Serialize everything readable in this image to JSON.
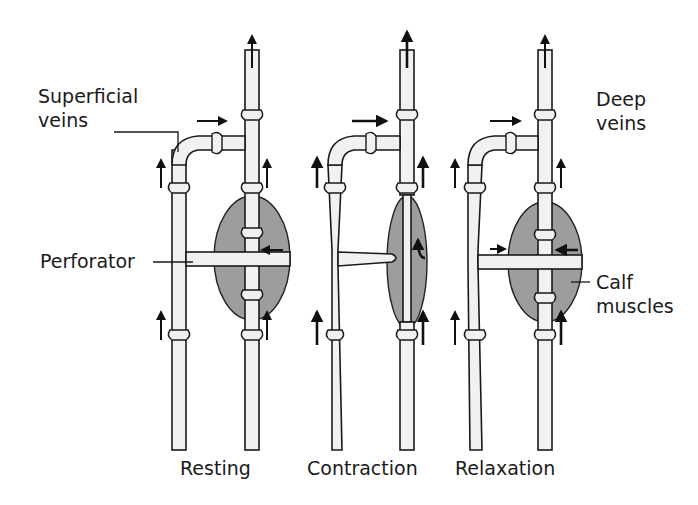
{
  "diagram": {
    "labels": {
      "superficial_veins": [
        "Superficial",
        "veins"
      ],
      "deep_veins": [
        "Deep",
        "veins"
      ],
      "perforator": "Perforator",
      "calf_muscles": [
        "Calf",
        "muscles"
      ]
    },
    "panels": [
      {
        "name": "Resting",
        "label": "Resting"
      },
      {
        "name": "Contraction",
        "label": "Contraction"
      },
      {
        "name": "Relaxation",
        "label": "Relaxation"
      }
    ],
    "colors": {
      "vein_fill": "#f1f1f1",
      "muscle_fill": "#9d9d9d",
      "outline": "#1a1a1a",
      "background": "#ffffff"
    }
  }
}
